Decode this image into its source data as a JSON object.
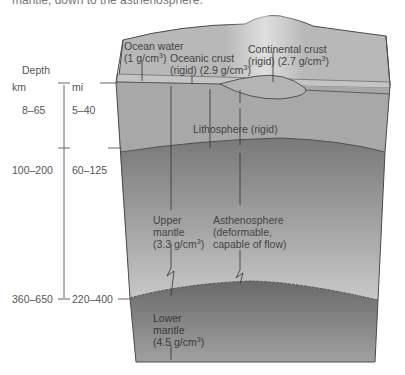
{
  "caption_fragment": "mantle, down to the asthenosphere.",
  "depth_axis": {
    "title": "Depth",
    "unit_km": "km",
    "unit_mi": "mi",
    "ticks": [
      {
        "km": "8–65",
        "mi": "5–40"
      },
      {
        "km": "100–200",
        "mi": "60–125"
      },
      {
        "km": "360–650",
        "mi": "220–400"
      }
    ]
  },
  "labels": {
    "ocean_water": {
      "name": "Ocean water",
      "density": "(1 g/cm",
      "sup": "3",
      "close": ")"
    },
    "oceanic_crust": {
      "name": "Oceanic crust",
      "density": "(rigid) (2.9 g/cm",
      "sup": "3",
      "close": ")"
    },
    "continental_crust": {
      "name": "Continental crust",
      "density": "(rigid) (2.7 g/cm",
      "sup": "3",
      "close": ")"
    },
    "lithosphere": {
      "name": "Lithosphere (rigid)"
    },
    "upper_mantle": {
      "line1": "Upper",
      "line2": "mantle",
      "density": "(3.3 g/cm",
      "sup": "3",
      "close": ")"
    },
    "asthenosphere": {
      "line1": "Asthenosphere",
      "line2": "(deformable,",
      "line3": "capable of flow)"
    },
    "lower_mantle": {
      "line1": "Lower",
      "line2": "mantle",
      "density": "(4.5 g/cm",
      "sup": "3",
      "close": ")"
    }
  },
  "colors": {
    "surface": "#b9b9b9",
    "lithosphere": "#a9a9a9",
    "asthenosphere_top": "#7a7a7a",
    "asthenosphere_bottom": "#c4c4c4",
    "lower_mantle_top": "#6e6e6e",
    "lower_mantle_bottom": "#9a9a9a",
    "outline": "#4a4a4a"
  }
}
